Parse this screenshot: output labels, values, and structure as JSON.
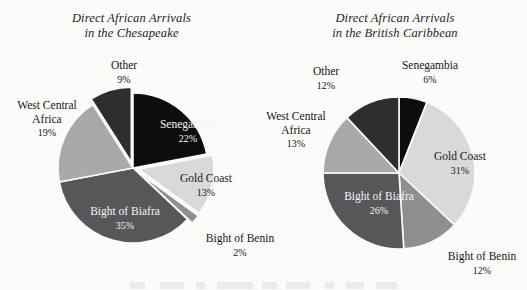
{
  "page": {
    "background_color": "#fbfbfa",
    "ink_color": "#1a1a1a"
  },
  "charts": [
    {
      "id": "chesapeake",
      "title_line1": "Direct African Arrivals",
      "title_line2": "in the Chesapeake",
      "center": {
        "x": 133,
        "y": 168
      },
      "radius": 75,
      "slices": [
        {
          "name": "Senegambia",
          "percent": 22,
          "label": "Senegambia",
          "pct_label": "22%",
          "color": "#0d0d0d",
          "label_placement": "inside-dark",
          "exploded": false
        },
        {
          "name": "Gold Coast",
          "percent": 13,
          "label": "Gold Coast",
          "pct_label": "13%",
          "color": "#d9d9d7",
          "label_placement": "inside-light",
          "exploded": true
        },
        {
          "name": "Bight of Benin",
          "percent": 2,
          "label": "Bight of Benin",
          "pct_label": "2%",
          "color": "#8f8f8d",
          "label_placement": "callout",
          "exploded": true
        },
        {
          "name": "Bight of Biafra",
          "percent": 35,
          "label": "Bight of Biafra",
          "pct_label": "35%",
          "color": "#57575a",
          "label_placement": "inside-dark",
          "exploded": false
        },
        {
          "name": "West Central Africa",
          "percent": 19,
          "label": "West Central Africa",
          "pct_label": "19%",
          "color": "#a9a9a7",
          "label_placement": "callout",
          "exploded": false
        },
        {
          "name": "Other",
          "percent": 9,
          "label": "Other",
          "pct_label": "9%",
          "color": "#2e2e30",
          "label_placement": "callout",
          "exploded": true
        }
      ],
      "callouts": [
        {
          "key": "other",
          "name": "Other",
          "pct_label": "9%",
          "x": 96,
          "y": 59
        },
        {
          "key": "wca",
          "name": "West Central Africa",
          "name_line1": "West Central",
          "name_line2": "Africa",
          "pct_label": "19%",
          "x": 4,
          "y": 99
        },
        {
          "key": "benin",
          "name": "Bight of Benin",
          "pct_label": "2%",
          "x": 198,
          "y": 232
        }
      ],
      "inside_labels": [
        {
          "key": "senegambia",
          "name": "Senegambia",
          "pct_label": "22%",
          "x": 152,
          "y": 118
        },
        {
          "key": "goldcoast",
          "name": "Gold Coast",
          "pct_label": "13%",
          "x": 170,
          "y": 172
        },
        {
          "key": "biafra",
          "name": "Bight of Biafra",
          "pct_label": "35%",
          "x": 78,
          "y": 205
        }
      ]
    },
    {
      "id": "caribbean",
      "title_line1": "Direct African Arrivals",
      "title_line2": "in the British Caribbean",
      "center": {
        "x": 399,
        "y": 173
      },
      "radius": 76,
      "slices": [
        {
          "name": "Senegambia",
          "percent": 6,
          "label": "Senegambia",
          "pct_label": "6%",
          "color": "#0d0d0d",
          "label_placement": "callout",
          "exploded": false
        },
        {
          "name": "Gold Coast",
          "percent": 31,
          "label": "Gold Coast",
          "pct_label": "31%",
          "color": "#d9d9d7",
          "label_placement": "inside-light",
          "exploded": false
        },
        {
          "name": "Bight of Benin",
          "percent": 12,
          "label": "Bight of Benin",
          "pct_label": "12%",
          "color": "#8f8f8d",
          "label_placement": "callout",
          "exploded": false
        },
        {
          "name": "Bight of Biafra",
          "percent": 26,
          "label": "Bight of Biafra",
          "pct_label": "26%",
          "color": "#57575a",
          "label_placement": "inside-dark",
          "exploded": false
        },
        {
          "name": "West Central Africa",
          "percent": 13,
          "label": "West Central Africa",
          "pct_label": "13%",
          "color": "#a9a9a7",
          "label_placement": "callout",
          "exploded": false
        },
        {
          "name": "Other",
          "percent": 12,
          "label": "Other",
          "pct_label": "12%",
          "color": "#2e2e30",
          "label_placement": "callout",
          "exploded": false
        }
      ],
      "callouts": [
        {
          "key": "senegambia",
          "name": "Senegambia",
          "pct_label": "6%",
          "x": 391,
          "y": 59
        },
        {
          "key": "other",
          "name": "Other",
          "pct_label": "12%",
          "x": 298,
          "y": 65
        },
        {
          "key": "wca",
          "name": "West Central Africa",
          "name_line1": "West Central",
          "name_line2": "Africa",
          "pct_label": "13%",
          "x": 253,
          "y": 110
        },
        {
          "key": "benin",
          "name": "Bight of Benin",
          "pct_label": "12%",
          "x": 440,
          "y": 250
        }
      ],
      "inside_labels": [
        {
          "key": "goldcoast",
          "name": "Gold Coast",
          "pct_label": "31%",
          "x": 424,
          "y": 150
        },
        {
          "key": "biafra",
          "name": "Bight of Biafra",
          "pct_label": "26%",
          "x": 332,
          "y": 190
        }
      ]
    }
  ],
  "chart_data": [
    {
      "type": "pie",
      "title": "Direct African Arrivals in the Chesapeake",
      "categories": [
        "Senegambia",
        "Gold Coast",
        "Bight of Benin",
        "Bight of Biafra",
        "West Central Africa",
        "Other"
      ],
      "values": [
        22,
        13,
        2,
        35,
        19,
        9
      ],
      "value_labels": [
        "22%",
        "13%",
        "2%",
        "35%",
        "19%",
        "9%"
      ],
      "units": "percent",
      "legend": "none (direct slice labels)",
      "colors": [
        "#0d0d0d",
        "#d9d9d7",
        "#8f8f8d",
        "#57575a",
        "#a9a9a7",
        "#2e2e30"
      ],
      "start_angle_deg": 0,
      "direction": "clockwise",
      "exploded_slices": [
        "Gold Coast",
        "Bight of Benin",
        "Other"
      ]
    },
    {
      "type": "pie",
      "title": "Direct African Arrivals in the British Caribbean",
      "categories": [
        "Senegambia",
        "Gold Coast",
        "Bight of Benin",
        "Bight of Biafra",
        "West Central Africa",
        "Other"
      ],
      "values": [
        6,
        31,
        12,
        26,
        13,
        12
      ],
      "value_labels": [
        "6%",
        "31%",
        "12%",
        "26%",
        "13%",
        "12%"
      ],
      "units": "percent",
      "legend": "none (direct slice labels)",
      "colors": [
        "#0d0d0d",
        "#d9d9d7",
        "#8f8f8d",
        "#57575a",
        "#a9a9a7",
        "#2e2e30"
      ],
      "start_angle_deg": 0,
      "direction": "clockwise",
      "exploded_slices": []
    }
  ]
}
